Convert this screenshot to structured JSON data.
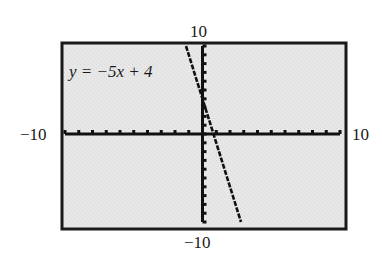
{
  "chart_data": {
    "type": "line",
    "title": "",
    "equation_label": "y = −5x + 4",
    "equation": {
      "slope": -5,
      "intercept": 4
    },
    "xlim": [
      -10,
      10
    ],
    "ylim": [
      -10,
      10
    ],
    "x_tick_step": 1,
    "y_tick_step": 1,
    "grid": false,
    "axis_labels": {
      "x_min": "−10",
      "x_max": "10",
      "y_min": "−10",
      "y_max": "10"
    },
    "series": [
      {
        "name": "y = -5x + 4",
        "x": [
          -1.2,
          2.8
        ],
        "y": [
          10,
          -10
        ]
      }
    ],
    "colors": {
      "background": "#e6e6e6",
      "frame": "#1a1a1a",
      "line": "#111111"
    }
  }
}
